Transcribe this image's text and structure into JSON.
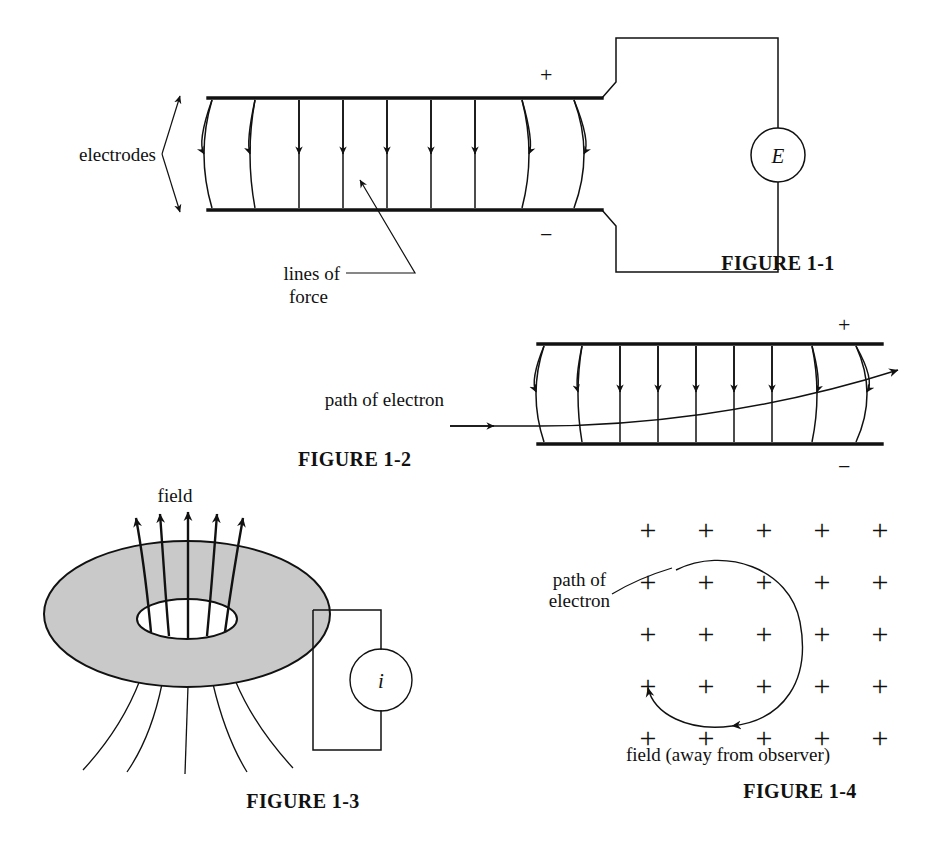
{
  "page": {
    "background": "#ffffff",
    "ink": "#111111",
    "shade": "#c9c9c9",
    "width": 928,
    "height": 841
  },
  "figures": [
    {
      "id": "figure-1-1",
      "caption": "FIGURE 1-1",
      "subject": "parallel-plate capacitor with electric lines of force and source E",
      "labels": {
        "electrodes": "electrodes",
        "lines_of_force_line1": "lines of",
        "lines_of_force_line2": "force",
        "plus": "+",
        "minus": "−",
        "source": "E"
      },
      "field_lines": 9,
      "field_direction": "downward, from positive upper plate to negative lower plate"
    },
    {
      "id": "figure-1-2",
      "caption": "FIGURE 1-2",
      "subject": "electron deflected by electric field between charged plates",
      "labels": {
        "path_of_electron": "path of electron",
        "plus": "+",
        "minus": "−"
      },
      "field_lines": 9,
      "field_direction": "downward",
      "electron_path": "enters horizontally at left, curves upward toward the positive plate and exits at upper right"
    },
    {
      "id": "figure-1-3",
      "caption": "FIGURE 1-3",
      "subject": "toroidal coil producing a magnetic field, driven by current i",
      "labels": {
        "field": "field",
        "source": "i"
      },
      "arrows_above": 5,
      "lines_below": 5
    },
    {
      "id": "figure-1-4",
      "caption": "FIGURE 1-4",
      "subject": "electron spiralling in a magnetic field directed away from the observer",
      "labels": {
        "path_of_electron_line1": "path of",
        "path_of_electron_line2": "electron",
        "field_note": "field (away from observer)",
        "field_marker": "+"
      },
      "grid": {
        "rows": 5,
        "cols": 5,
        "marker": "+"
      },
      "electron_path": "open spiral, arrowheads at both ends, counter-clockwise"
    }
  ]
}
